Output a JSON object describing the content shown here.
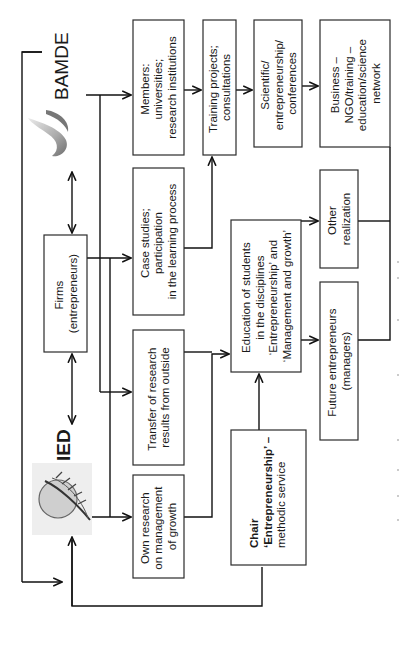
{
  "diagram": {
    "orientation": "rotated-90-ccw",
    "logos": {
      "bamde": {
        "label": "BAMDE",
        "icon": "swoosh-logo-icon"
      },
      "ied": {
        "label": "IED",
        "icon": "feather-globe-logo-icon"
      }
    },
    "boxes": {
      "firms": {
        "lines": [
          "Firms",
          "(entrepreneurs)"
        ]
      },
      "members": {
        "lines": [
          "Members:",
          "universities;",
          "research institutions"
        ]
      },
      "training": {
        "lines": [
          "Training projects;",
          "consultations"
        ]
      },
      "scientific": {
        "lines": [
          "Scientific/",
          "entrepreneurship/",
          "conferences"
        ]
      },
      "business": {
        "lines": [
          "Business –",
          "NGO/training –",
          "education/science",
          "network"
        ]
      },
      "case_studies": {
        "lines": [
          "Case studies;",
          "participation",
          "in the learning process"
        ]
      },
      "transfer": {
        "lines": [
          "Transfer of research",
          "results from outside"
        ]
      },
      "own_research": {
        "lines": [
          "Own research",
          "on management",
          "of growth"
        ]
      },
      "education": {
        "lines": [
          "Education of students",
          "in the disciplines",
          "‘Entrepreneurship’ and",
          "‘Management and growth’"
        ]
      },
      "other": {
        "lines": [
          "Other",
          "realization"
        ]
      },
      "future": {
        "lines": [
          "Future entrepreneurs",
          "(managers)"
        ]
      },
      "chair": {
        "lines": [
          "Chair",
          "‘Entrepreneurship’ –",
          "methodic service"
        ]
      }
    },
    "caption": "",
    "colors": {
      "line": "#111111",
      "box_border": "#2b2b2b",
      "background": "#ffffff",
      "logo_gray": "#8a8a8a"
    }
  }
}
